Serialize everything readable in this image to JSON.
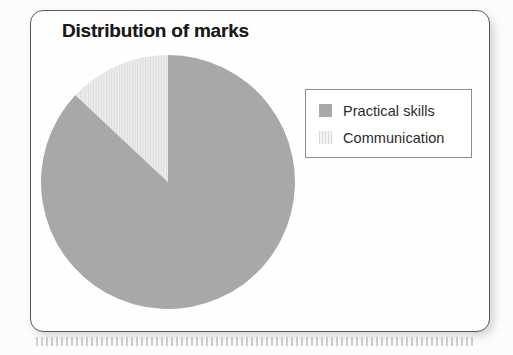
{
  "figure": {
    "title": "Distribution of marks",
    "card_border_color": "#59595b",
    "background_color": "#ffffff"
  },
  "chart_data": {
    "type": "pie",
    "title": "Distribution of marks",
    "labels": [
      "Practical skills",
      "Communication"
    ],
    "values": [
      87,
      13
    ],
    "units": "percent",
    "colors": [
      "#a8a8a8",
      "#e8e8e8"
    ],
    "patterns": [
      "solid",
      "vertical-stripes"
    ],
    "start_angle_deg": 0,
    "direction": "counter-clockwise",
    "legend_position": "right",
    "grid": false,
    "xlabel": "",
    "ylabel": ""
  },
  "legend": {
    "entries": [
      {
        "label": "Practical skills",
        "swatch": "solid-gray-swatch"
      },
      {
        "label": "Communication",
        "swatch": "striped-light-swatch"
      }
    ]
  }
}
